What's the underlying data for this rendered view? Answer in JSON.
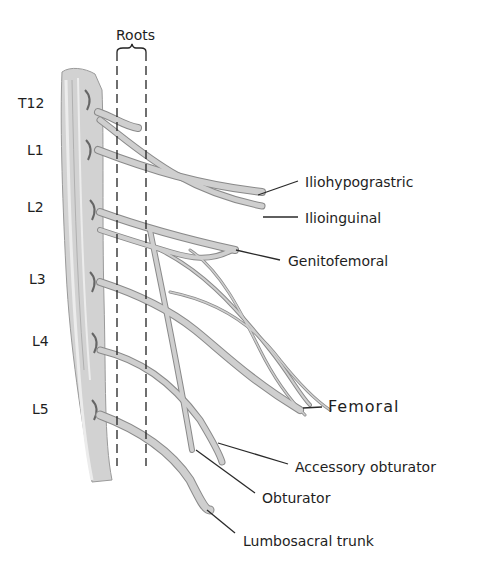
{
  "diagram": {
    "roots_label": "Roots",
    "segments": [
      {
        "label": "T12",
        "x": 24,
        "y": 96
      },
      {
        "label": "L1",
        "x": 29,
        "y": 141
      },
      {
        "label": "L2",
        "x": 29,
        "y": 199
      },
      {
        "label": "L3",
        "x": 29,
        "y": 271
      },
      {
        "label": "L4",
        "x": 33,
        "y": 334
      },
      {
        "label": "L5",
        "x": 33,
        "y": 402
      }
    ],
    "nerves": [
      {
        "label": "Iliohypograstric",
        "x": 305,
        "y": 175
      },
      {
        "label": "Ilioinguinal",
        "x": 305,
        "y": 212
      },
      {
        "label": "Genitofemoral",
        "x": 288,
        "y": 254
      },
      {
        "label": "Femoral",
        "x": 328,
        "y": 400
      },
      {
        "label": "Accessory obturator",
        "x": 295,
        "y": 460
      },
      {
        "label": "Obturator",
        "x": 262,
        "y": 494
      },
      {
        "label": "Lumbosacral trunk",
        "x": 243,
        "y": 536
      }
    ],
    "colors": {
      "nerve_fill": "#c8c8c8",
      "nerve_stroke": "#8a8a8a",
      "text": "#1e1e1e",
      "leader": "#2a2a2a"
    }
  }
}
